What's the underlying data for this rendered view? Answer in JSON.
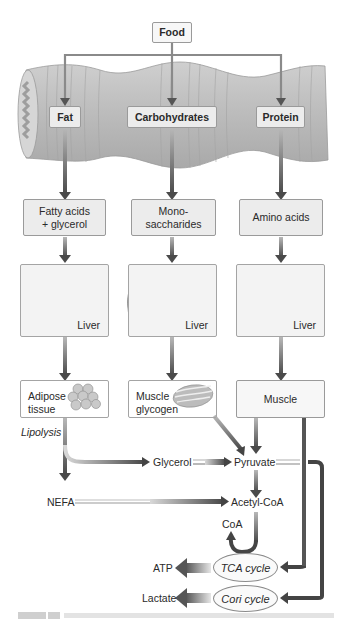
{
  "diagram": {
    "source": {
      "label": "Food"
    },
    "gut_categories": [
      {
        "id": "fat",
        "label": "Fat"
      },
      {
        "id": "carbohydrates",
        "label": "Carbohydrates"
      },
      {
        "id": "protein",
        "label": "Protein"
      }
    ],
    "absorbed_products": [
      {
        "id": "fatty-acids",
        "label": "Fatty acids\n+ glycerol"
      },
      {
        "id": "monosaccharides",
        "label": "Mono-\nsaccharides"
      },
      {
        "id": "amino-acids",
        "label": "Amino acids"
      }
    ],
    "organs": [
      {
        "id": "liver-1",
        "label": "Liver"
      },
      {
        "id": "liver-2",
        "label": "Liver"
      },
      {
        "id": "liver-3",
        "label": "Liver"
      }
    ],
    "tissues": [
      {
        "id": "adipose",
        "label": "Adipose\ntissue"
      },
      {
        "id": "muscle-glycogen",
        "label": "Muscle\nglycogen"
      },
      {
        "id": "muscle",
        "label": "Muscle"
      }
    ],
    "process_label": "Lipolysis",
    "metabolites": {
      "glycerol": "Glycerol",
      "pyruvate": "Pyruvate",
      "nefa": "NEFA",
      "acetyl_coa": "Acetyl-CoA",
      "coa": "CoA",
      "atp": "ATP",
      "lactate": "Lactate"
    },
    "cycles": {
      "tca": "TCA cycle",
      "cori": "Cori cycle"
    },
    "colors": {
      "arrow_dark": "#4a4a4a",
      "arrow_light": "#d0d0d0",
      "box_fill": "#ececec",
      "box_border": "#9a9a9a",
      "gut_tube": "#b9b9b9",
      "liver": "#7a7a7a"
    }
  }
}
